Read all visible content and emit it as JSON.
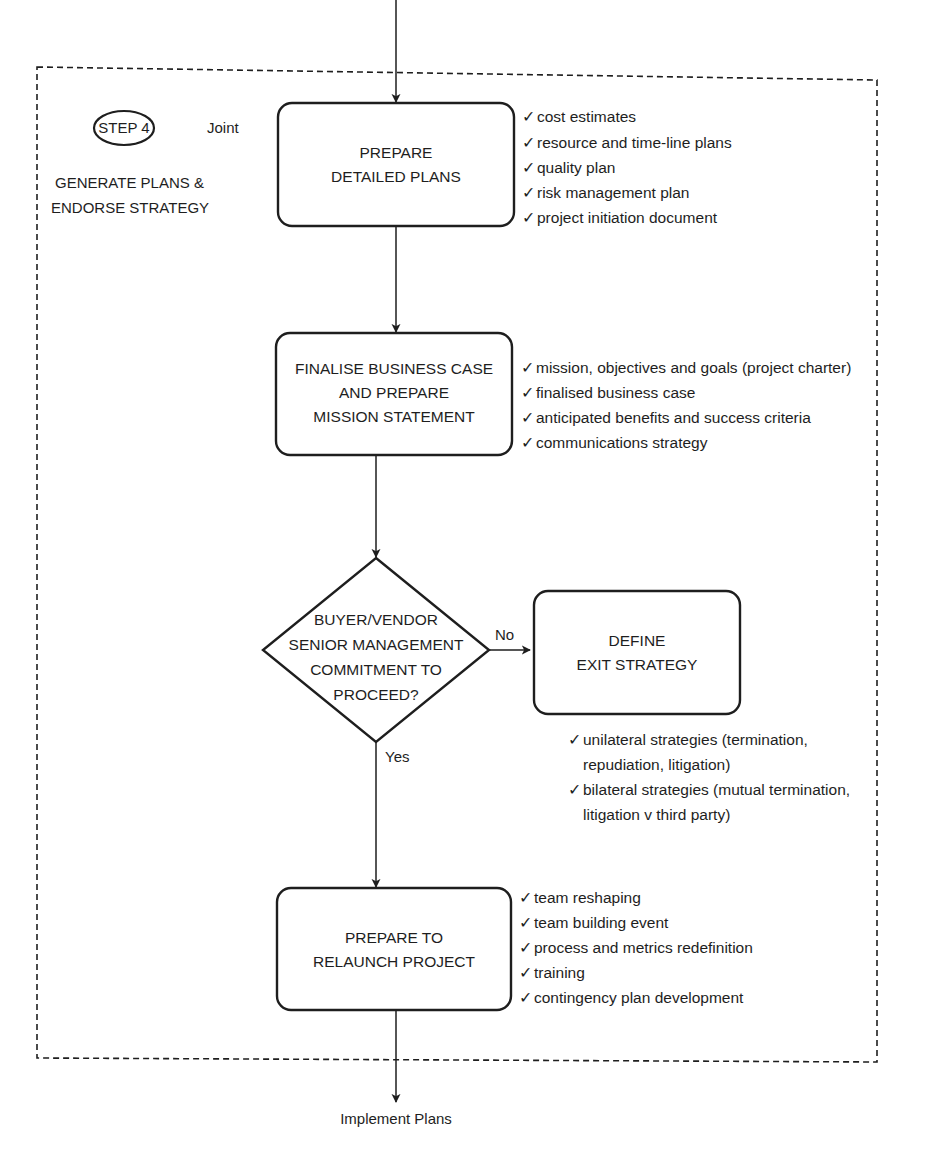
{
  "step": {
    "badge": "STEP 4",
    "party": "Joint",
    "title_lines": [
      "GENERATE PLANS &",
      "ENDORSE STRATEGY"
    ]
  },
  "nodes": {
    "prepare_plans": {
      "lines": [
        "PREPARE",
        "DETAILED PLANS"
      ],
      "checklist": [
        "cost estimates",
        "resource and time-line plans",
        "quality plan",
        "risk management plan",
        "project initiation document"
      ]
    },
    "finalise_case": {
      "lines": [
        "FINALISE BUSINESS CASE",
        "AND PREPARE",
        "MISSION STATEMENT"
      ],
      "checklist": [
        "mission, objectives and goals (project charter)",
        "finalised business case",
        "anticipated benefits and success criteria",
        "communications strategy"
      ]
    },
    "decision": {
      "lines": [
        "BUYER/VENDOR",
        "SENIOR MANAGEMENT",
        "COMMITMENT TO",
        "PROCEED?"
      ],
      "no_label": "No",
      "yes_label": "Yes"
    },
    "exit_strategy": {
      "lines": [
        "DEFINE",
        "EXIT STRATEGY"
      ],
      "checklist": [
        [
          "unilateral strategies (termination,",
          "repudiation, litigation)"
        ],
        [
          "bilateral strategies (mutual termination,",
          "litigation v third party)"
        ]
      ]
    },
    "relaunch": {
      "lines": [
        "PREPARE TO",
        "RELAUNCH PROJECT"
      ],
      "checklist": [
        "team reshaping",
        "team building event",
        "process and metrics redefinition",
        "training",
        "contingency plan development"
      ]
    }
  },
  "output_label": "Implement Plans",
  "check_glyph": "✓",
  "colors": {
    "stroke": "#1e1e1e",
    "background": "#ffffff"
  }
}
